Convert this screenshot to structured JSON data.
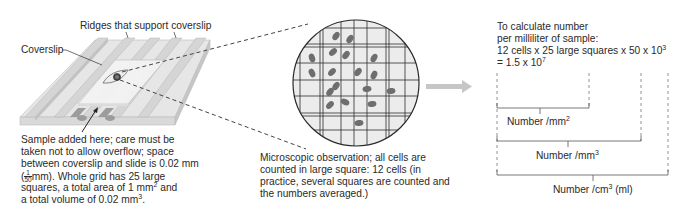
{
  "labels": {
    "ridges": "Ridges that support coverslip",
    "coverslip": "Coverslip",
    "sample_note": {
      "line1": "Sample added here; care must be",
      "line2": "taken not to allow overflow; space",
      "line3": "between coverslip and slide is 0.02 mm",
      "line4_frac_num": "1",
      "line4_frac_den": "50",
      "line4_rest": "mm).  Whole grid has 25 large",
      "line5_pre": "squares, a total area of 1 mm",
      "line5_sup": "2",
      "line5_post": " and",
      "line6_pre": "a total volume of 0.02 mm",
      "line6_sup": "3",
      "line6_post": "."
    },
    "micro_note": {
      "line1": "Microscopic observation; all cells are",
      "line2": "counted in large square: 12 cells (in",
      "line3": "practice, several squares are counted and",
      "line4": "the numbers averaged.)"
    },
    "calc": {
      "line1": "To calculate number",
      "line2": "per milliliter of sample:",
      "line3_pre": "12 cells x 25 large squares x 50 x 10",
      "line3_sup": "3",
      "line4_pre": "= 1.5 x 10",
      "line4_sup": "7"
    },
    "brackets": {
      "mm2_pre": "Number /mm",
      "mm2_sup": "2",
      "mm3_pre": "Number /mm",
      "mm3_sup": "3",
      "cm3_pre": "Number /cm",
      "cm3_sup": "3",
      "cm3_post": " (ml)"
    }
  },
  "counts": {
    "cells_in_large_square": 12,
    "large_squares": 25,
    "result": "1.5 x 10^7"
  },
  "colors": {
    "slide_light": "#e4e4e4",
    "slide_mid": "#cfcfcf",
    "slide_dark": "#b9b9b9",
    "channel": "#9a9a9a",
    "cell": "#6e6e6e",
    "arrow": "#c4c4c4",
    "grid_fill": "#ececec",
    "line": "#333333",
    "dash": "#8a8a8a"
  }
}
